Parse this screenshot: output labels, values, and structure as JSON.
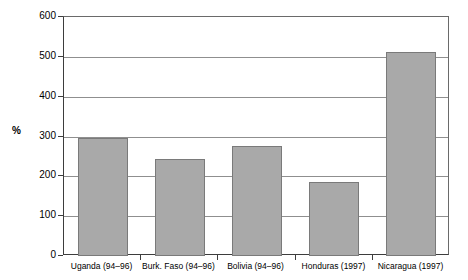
{
  "chart_data": {
    "type": "bar",
    "title": "",
    "subtitle": "",
    "xlabel": "",
    "ylabel": "%",
    "ylim": [
      0,
      600
    ],
    "ytick_step": 100,
    "yticks": [
      0,
      100,
      200,
      300,
      400,
      500,
      600
    ],
    "ytick_labels": [
      "0",
      "100",
      "200",
      "300",
      "400",
      "500",
      "600"
    ],
    "grid": "horizontal",
    "legend": "none",
    "categories": [
      "Uganda (94–96)",
      "Burk. Faso (94–96)",
      "Bolivia (94–96)",
      "Honduras (1997)",
      "Nicaragua (1997)"
    ],
    "values": [
      297,
      243,
      275,
      185,
      513
    ],
    "bar_color": "#a9a9a9",
    "bar_edge_color": "#7a7a7a",
    "gridline_color": "#8f8f8f",
    "axis_color": "#3d3d3d"
  }
}
